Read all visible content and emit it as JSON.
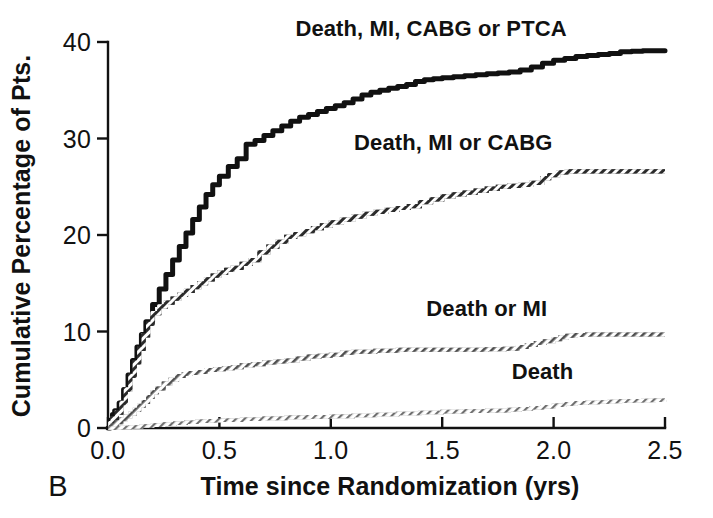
{
  "figure": {
    "panel_label": "B",
    "background_color": "#ffffff",
    "foreground_color": "#111111"
  },
  "chart_data": {
    "type": "line",
    "title": "",
    "subtitle": "",
    "xlabel": "Time since Randomization (yrs)",
    "ylabel": "Cumulative Percentage of Pts.",
    "xlim": [
      0.0,
      2.5
    ],
    "ylim": [
      0,
      40
    ],
    "xticks": [
      "0.0",
      "0.5",
      "1.0",
      "1.5",
      "2.0",
      "2.5"
    ],
    "xtick_values": [
      0.0,
      0.5,
      1.0,
      1.5,
      2.0,
      2.5
    ],
    "yticks": [
      "0",
      "10",
      "20",
      "30",
      "40"
    ],
    "ytick_values": [
      0,
      10,
      20,
      30,
      40
    ],
    "grid": false,
    "legend_position": "inline-right-of-curve",
    "step_style": "kaplan-meier-step",
    "series": [
      {
        "name": "Death, MI, CABG or PTCA",
        "color": "#111111",
        "style": "solid",
        "stroke_width": 5.0,
        "label_x": 1.45,
        "label_y": 40.6,
        "final_value": 39.1,
        "x": [
          0.0,
          0.01,
          0.02,
          0.03,
          0.05,
          0.07,
          0.09,
          0.11,
          0.13,
          0.15,
          0.17,
          0.2,
          0.23,
          0.26,
          0.29,
          0.32,
          0.35,
          0.38,
          0.41,
          0.44,
          0.47,
          0.5,
          0.54,
          0.58,
          0.62,
          0.62,
          0.66,
          0.7,
          0.74,
          0.78,
          0.82,
          0.86,
          0.9,
          0.94,
          0.98,
          1.02,
          1.06,
          1.1,
          1.14,
          1.18,
          1.22,
          1.26,
          1.3,
          1.34,
          1.38,
          1.42,
          1.46,
          1.5,
          1.55,
          1.6,
          1.65,
          1.7,
          1.75,
          1.8,
          1.85,
          1.9,
          1.95,
          2.0,
          2.05,
          2.1,
          2.15,
          2.2,
          2.25,
          2.3,
          2.35,
          2.4,
          2.45,
          2.5
        ],
        "y": [
          0.0,
          0.8,
          1.4,
          1.8,
          2.6,
          4.0,
          5.5,
          7.0,
          8.4,
          9.7,
          11.0,
          12.8,
          14.4,
          15.9,
          17.4,
          18.8,
          20.2,
          21.6,
          22.9,
          24.2,
          25.2,
          26.1,
          27.1,
          27.9,
          28.5,
          29.4,
          29.8,
          30.3,
          30.8,
          31.3,
          31.8,
          32.2,
          32.5,
          32.8,
          33.1,
          33.4,
          33.7,
          34.1,
          34.5,
          34.8,
          35.0,
          35.2,
          35.4,
          35.6,
          35.9,
          36.1,
          36.2,
          36.3,
          36.4,
          36.5,
          36.6,
          36.7,
          36.8,
          36.9,
          37.1,
          37.4,
          37.8,
          38.1,
          38.3,
          38.5,
          38.6,
          38.7,
          38.8,
          39.0,
          39.05,
          39.1,
          39.1,
          39.1
        ]
      },
      {
        "name": "Death, MI or CABG",
        "color": "#4a4a4a",
        "style": "hatched",
        "stroke_width": 4.2,
        "label_x": 1.55,
        "label_y": 28.8,
        "final_value": 26.6,
        "x": [
          0.0,
          0.01,
          0.02,
          0.04,
          0.06,
          0.08,
          0.1,
          0.12,
          0.14,
          0.16,
          0.18,
          0.2,
          0.23,
          0.26,
          0.29,
          0.32,
          0.35,
          0.38,
          0.41,
          0.44,
          0.47,
          0.5,
          0.53,
          0.56,
          0.6,
          0.64,
          0.68,
          0.72,
          0.76,
          0.8,
          0.84,
          0.88,
          0.92,
          0.96,
          1.0,
          1.05,
          1.1,
          1.15,
          1.2,
          1.25,
          1.3,
          1.35,
          1.4,
          1.45,
          1.5,
          1.55,
          1.6,
          1.65,
          1.7,
          1.75,
          1.8,
          1.85,
          1.9,
          1.95,
          1.98,
          2.02,
          2.06,
          2.1,
          2.15,
          2.2,
          2.25,
          2.3,
          2.35,
          2.4,
          2.45,
          2.5
        ],
        "y": [
          0.0,
          0.5,
          1.0,
          1.6,
          2.6,
          4.0,
          5.4,
          6.8,
          8.2,
          9.6,
          10.8,
          11.9,
          12.6,
          13.0,
          13.4,
          13.8,
          14.2,
          14.6,
          15.0,
          15.4,
          15.8,
          16.1,
          16.4,
          16.6,
          17.0,
          17.4,
          18.2,
          18.8,
          19.3,
          19.8,
          20.1,
          20.4,
          20.7,
          21.0,
          21.3,
          21.6,
          21.9,
          22.2,
          22.4,
          22.6,
          22.8,
          23.0,
          23.4,
          23.7,
          24.0,
          24.2,
          24.4,
          24.6,
          24.8,
          25.0,
          25.1,
          25.2,
          25.4,
          25.9,
          26.2,
          26.5,
          26.6,
          26.6,
          26.6,
          26.6,
          26.6,
          26.6,
          26.6,
          26.6,
          26.6,
          26.6
        ]
      },
      {
        "name": "Death or MI",
        "color": "#7d7d7d",
        "style": "hatched",
        "stroke_width": 4.0,
        "label_x": 1.7,
        "label_y": 11.6,
        "final_value": 9.7,
        "x": [
          0.0,
          0.02,
          0.04,
          0.06,
          0.08,
          0.1,
          0.12,
          0.14,
          0.16,
          0.18,
          0.2,
          0.22,
          0.25,
          0.28,
          0.31,
          0.34,
          0.37,
          0.4,
          0.44,
          0.48,
          0.52,
          0.56,
          0.6,
          0.65,
          0.7,
          0.75,
          0.8,
          0.85,
          0.9,
          0.95,
          1.0,
          1.05,
          1.1,
          1.2,
          1.3,
          1.4,
          1.5,
          1.6,
          1.7,
          1.78,
          1.84,
          1.88,
          1.92,
          1.96,
          2.0,
          2.03,
          2.06,
          2.1,
          2.15,
          2.2,
          2.3,
          2.4,
          2.5
        ],
        "y": [
          0.0,
          0.3,
          0.6,
          0.9,
          1.2,
          1.5,
          1.9,
          2.3,
          2.7,
          3.2,
          3.7,
          4.1,
          4.6,
          5.0,
          5.4,
          5.6,
          5.7,
          5.8,
          6.0,
          6.1,
          6.2,
          6.3,
          6.5,
          6.6,
          6.8,
          6.9,
          7.0,
          7.2,
          7.4,
          7.5,
          7.6,
          7.8,
          7.9,
          8.0,
          8.1,
          8.1,
          8.1,
          8.1,
          8.15,
          8.2,
          8.4,
          8.6,
          8.8,
          9.0,
          9.2,
          9.4,
          9.55,
          9.65,
          9.7,
          9.7,
          9.7,
          9.7,
          9.7
        ]
      },
      {
        "name": "Death",
        "color": "#8d8d8d",
        "style": "hatched",
        "stroke_width": 3.6,
        "label_x": 1.95,
        "label_y": 5.1,
        "final_value": 2.9,
        "x": [
          0.0,
          0.05,
          0.1,
          0.15,
          0.2,
          0.25,
          0.3,
          0.35,
          0.4,
          0.45,
          0.5,
          0.6,
          0.7,
          0.8,
          0.9,
          1.0,
          1.1,
          1.2,
          1.3,
          1.4,
          1.5,
          1.6,
          1.7,
          1.8,
          1.85,
          1.9,
          1.95,
          2.0,
          2.05,
          2.1,
          2.15,
          2.2,
          2.25,
          2.3,
          2.35,
          2.4,
          2.45,
          2.5
        ],
        "y": [
          0.0,
          0.05,
          0.1,
          0.2,
          0.3,
          0.4,
          0.5,
          0.6,
          0.7,
          0.75,
          0.8,
          0.9,
          1.0,
          1.1,
          1.15,
          1.2,
          1.3,
          1.4,
          1.5,
          1.6,
          1.7,
          1.75,
          1.8,
          1.9,
          2.0,
          2.1,
          2.2,
          2.35,
          2.5,
          2.6,
          2.65,
          2.7,
          2.75,
          2.8,
          2.82,
          2.85,
          2.88,
          2.9
        ]
      }
    ]
  }
}
